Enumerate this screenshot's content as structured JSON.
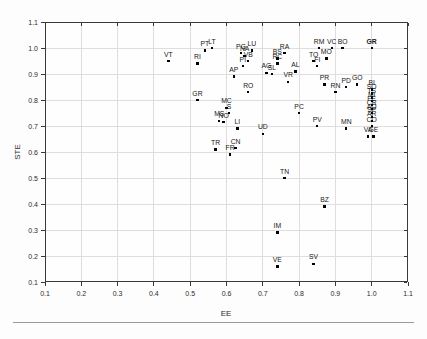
{
  "figure_caption": "",
  "colors": {
    "marker": "#000000",
    "grid": "#dedede",
    "axis_frame": "#3a3a3a",
    "text": "#2b2b2b",
    "separator": "#9a9a9a"
  },
  "chart_data": {
    "type": "scatter",
    "title": "",
    "xlabel": "EE",
    "ylabel": "STE",
    "xlim": [
      0.1,
      1.1
    ],
    "ylim": [
      0.1,
      1.1
    ],
    "xticks": [
      0.1,
      0.2,
      0.3,
      0.4,
      0.5,
      0.6,
      0.7,
      0.8,
      0.9,
      1.0,
      1.1
    ],
    "yticks": [
      0.1,
      0.2,
      0.3,
      0.4,
      0.5,
      0.6,
      0.7,
      0.8,
      0.9,
      1.0,
      1.1
    ],
    "grid": true,
    "legend": false,
    "marker": "small-black-square",
    "points": [
      {
        "label": "VT",
        "ee": 0.44,
        "ste": 0.95
      },
      {
        "label": "RI",
        "ee": 0.52,
        "ste": 0.94
      },
      {
        "label": "PT",
        "ee": 0.54,
        "ste": 0.99
      },
      {
        "label": "LT",
        "ee": 0.56,
        "ste": 1.0
      },
      {
        "label": "PG",
        "ee": 0.64,
        "ste": 0.98
      },
      {
        "label": "LU",
        "ee": 0.67,
        "ste": 0.99
      },
      {
        "label": "NA",
        "ee": 0.65,
        "ste": 0.97
      },
      {
        "label": "VB",
        "ee": 0.66,
        "ste": 0.95
      },
      {
        "label": "PI",
        "ee": 0.645,
        "ste": 0.93
      },
      {
        "label": "AP",
        "ee": 0.62,
        "ste": 0.89
      },
      {
        "label": "RA",
        "ee": 0.76,
        "ste": 0.98
      },
      {
        "label": "BS",
        "ee": 0.74,
        "ste": 0.96
      },
      {
        "label": "RC",
        "ee": 0.74,
        "ste": 0.94
      },
      {
        "label": "RM",
        "ee": 0.855,
        "ste": 1.0
      },
      {
        "label": "VC",
        "ee": 0.89,
        "ste": 1.0
      },
      {
        "label": "BO",
        "ee": 0.92,
        "ste": 1.0
      },
      {
        "label": "GR",
        "ee": 1.0,
        "ste": 1.0,
        "bold": true
      },
      {
        "label": "TO",
        "ee": 0.84,
        "ste": 0.95
      },
      {
        "label": "MO",
        "ee": 0.875,
        "ste": 0.96
      },
      {
        "label": "FI",
        "ee": 0.85,
        "ste": 0.93
      },
      {
        "label": "AL",
        "ee": 0.79,
        "ste": 0.91
      },
      {
        "label": "VR",
        "ee": 0.77,
        "ste": 0.87
      },
      {
        "label": "AG",
        "ee": 0.71,
        "ste": 0.905
      },
      {
        "label": "SL",
        "ee": 0.725,
        "ste": 0.9
      },
      {
        "label": "RO",
        "ee": 0.66,
        "ste": 0.83
      },
      {
        "label": "GR",
        "ee": 0.52,
        "ste": 0.8
      },
      {
        "label": "MC",
        "ee": 0.6,
        "ste": 0.77
      },
      {
        "label": "S",
        "ee": 0.607,
        "ste": 0.75
      },
      {
        "label": "MS",
        "ee": 0.58,
        "ste": 0.72
      },
      {
        "label": "NO",
        "ee": 0.592,
        "ste": 0.715
      },
      {
        "label": "LI",
        "ee": 0.63,
        "ste": 0.69
      },
      {
        "label": "UD",
        "ee": 0.7,
        "ste": 0.67
      },
      {
        "label": "TR",
        "ee": 0.57,
        "ste": 0.61
      },
      {
        "label": "CN",
        "ee": 0.625,
        "ste": 0.615
      },
      {
        "label": "FR",
        "ee": 0.61,
        "ste": 0.59
      },
      {
        "label": "PC",
        "ee": 0.8,
        "ste": 0.75
      },
      {
        "label": "PV",
        "ee": 0.85,
        "ste": 0.7
      },
      {
        "label": "MN",
        "ee": 0.93,
        "ste": 0.69
      },
      {
        "label": "TN",
        "ee": 0.76,
        "ste": 0.5
      },
      {
        "label": "BZ",
        "ee": 0.87,
        "ste": 0.39
      },
      {
        "label": "IM",
        "ee": 0.74,
        "ste": 0.29
      },
      {
        "label": "VE",
        "ee": 0.74,
        "ste": 0.16
      },
      {
        "label": "SV",
        "ee": 0.84,
        "ste": 0.17
      },
      {
        "label": "PR",
        "ee": 0.87,
        "ste": 0.86
      },
      {
        "label": "RN",
        "ee": 0.9,
        "ste": 0.83
      },
      {
        "label": "PD",
        "ee": 0.93,
        "ste": 0.85
      },
      {
        "label": "GO",
        "ee": 0.96,
        "ste": 0.86
      },
      {
        "label": "BI",
        "ee": 1.0,
        "ste": 0.84
      },
      {
        "label": "SO",
        "ee": 1.0,
        "ste": 0.825
      },
      {
        "label": "TS",
        "ee": 1.0,
        "ste": 0.81
      },
      {
        "label": "MI",
        "ee": 1.0,
        "ste": 0.795
      },
      {
        "label": "FE",
        "ee": 1.0,
        "ste": 0.78
      },
      {
        "label": "CR",
        "ee": 1.0,
        "ste": 0.765
      },
      {
        "label": "AO",
        "ee": 1.0,
        "ste": 0.75
      },
      {
        "label": "SP",
        "ee": 1.0,
        "ste": 0.735
      },
      {
        "label": "AR",
        "ee": 1.0,
        "ste": 0.72
      },
      {
        "label": "CO",
        "ee": 1.0,
        "ste": 0.7
      },
      {
        "label": "VA",
        "ee": 0.99,
        "ste": 0.66
      },
      {
        "label": "GE",
        "ee": 1.005,
        "ste": 0.66
      }
    ]
  }
}
